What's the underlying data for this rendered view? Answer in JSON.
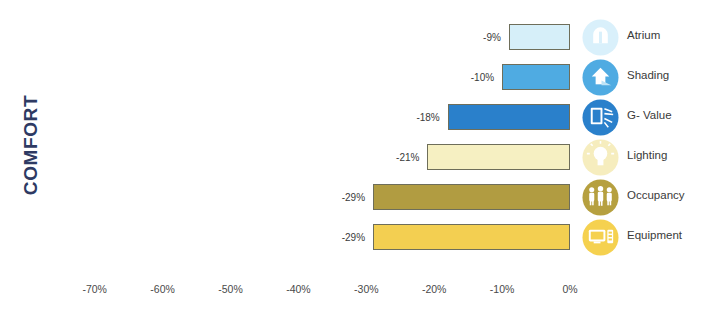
{
  "axis_title": "COMFORT",
  "axis_title_color": "#2e3a63",
  "chart_data": {
    "type": "bar",
    "orientation": "horizontal",
    "title": "COMFORT",
    "xlabel": "",
    "ylabel": "COMFORT",
    "xlim": [
      -75,
      2
    ],
    "grid": false,
    "legend": "right",
    "categories": [
      "Atrium",
      "Shading",
      "G- Value",
      "Lighting",
      "Occupancy",
      "Equipment"
    ],
    "values": [
      -9,
      -10,
      -18,
      -21,
      -29,
      -29
    ],
    "data_labels": [
      "-9%",
      "-10%",
      "-18%",
      "-21%",
      "-29%",
      "-29%"
    ],
    "bar_colors": [
      "#d6eff9",
      "#4fabe2",
      "#2a80cb",
      "#f6f0c2",
      "#b19c41",
      "#f3cf51"
    ],
    "bar_border_color": "#6e6e5a",
    "tick_labels": [
      "-70%",
      "-60%",
      "-50%",
      "-40%",
      "-30%",
      "-20%",
      "-10%",
      "0%"
    ],
    "tick_values": [
      -70,
      -60,
      -50,
      -40,
      -30,
      -20,
      -10,
      0
    ]
  },
  "rows": [
    {
      "label": "Atrium",
      "value_label": "-9%",
      "value": -9,
      "bar_color": "#d6eff9",
      "icon_color": "#d9f0fb",
      "icon_name": "atrium-icon"
    },
    {
      "label": "Shading",
      "value_label": "-10%",
      "value": -10,
      "bar_color": "#4fabe2",
      "icon_color": "#4fabe2",
      "icon_name": "shading-icon"
    },
    {
      "label": "G- Value",
      "value_label": "-18%",
      "value": -18,
      "bar_color": "#2a80cb",
      "icon_color": "#2a80cb",
      "icon_name": "g-value-icon"
    },
    {
      "label": "Lighting",
      "value_label": "-21%",
      "value": -21,
      "bar_color": "#f6f0c2",
      "icon_color": "#f6edbe",
      "icon_name": "lighting-icon"
    },
    {
      "label": "Occupancy",
      "value_label": "-29%",
      "value": -29,
      "bar_color": "#b19c41",
      "icon_color": "#b6a03f",
      "icon_name": "occupancy-icon"
    },
    {
      "label": "Equipment",
      "value_label": "-29%",
      "value": -29,
      "bar_color": "#f3cf51",
      "icon_color": "#f5d14f",
      "icon_name": "equipment-icon"
    }
  ],
  "x_ticks": [
    {
      "label": "-70%",
      "value": -70
    },
    {
      "label": "-60%",
      "value": -60
    },
    {
      "label": "-50%",
      "value": -50
    },
    {
      "label": "-40%",
      "value": -40
    },
    {
      "label": "-30%",
      "value": -30
    },
    {
      "label": "-20%",
      "value": -20
    },
    {
      "label": "-10%",
      "value": -10
    },
    {
      "label": "0%",
      "value": 0
    }
  ]
}
